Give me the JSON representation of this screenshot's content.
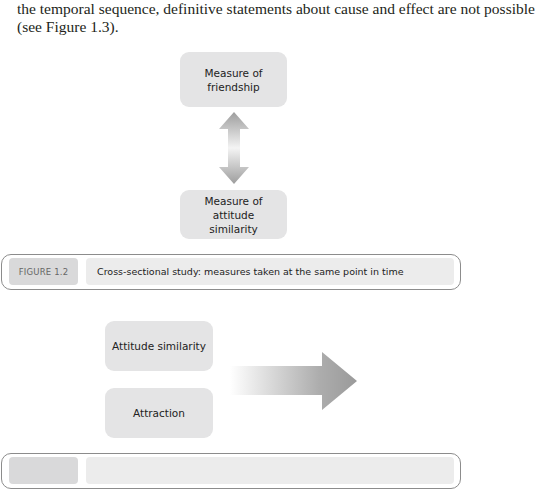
{
  "body_text": {
    "lines": [
      "the temporal sequence, definitive statements about cause and effect are not possible",
      "(see Figure 1.3)."
    ]
  },
  "figure_1_2": {
    "boxes": {
      "top": "Measure of friendship",
      "bottom": "Measure of attitude similarity"
    },
    "connector": "double-arrow-vertical",
    "caption": {
      "label": "FIGURE 1.2",
      "text": "Cross-sectional study: measures taken at the same point in time"
    }
  },
  "figure_1_3": {
    "boxes": {
      "first": "Attitude similarity",
      "second": "Attraction"
    },
    "connector": "arrow-right",
    "caption": {
      "label": "",
      "text": ""
    }
  },
  "colors": {
    "box_fill": "#e4e4e5",
    "arrow_gray": "#a6a6a6",
    "caption_badge": "#d9d9da",
    "caption_text_bg": "#ececec",
    "frame_border": "#8c8c8c"
  }
}
